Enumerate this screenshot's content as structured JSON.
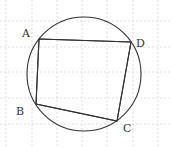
{
  "diagram": {
    "type": "cyclic-quadrilateral",
    "circle": {
      "cx": 84,
      "cy": 74,
      "r": 57
    },
    "vertices": [
      {
        "name": "A",
        "x": 39,
        "y": 39,
        "label": "A",
        "label_x": 22,
        "label_y": 37
      },
      {
        "name": "B",
        "x": 36,
        "y": 104,
        "label": "B",
        "label_x": 16,
        "label_y": 115
      },
      {
        "name": "C",
        "x": 117,
        "y": 121,
        "label": "C",
        "label_x": 123,
        "label_y": 132
      },
      {
        "name": "D",
        "x": 131,
        "y": 42,
        "label": "D",
        "label_x": 136,
        "label_y": 47
      }
    ],
    "edges": [
      "AD",
      "DC",
      "CB",
      "BA"
    ],
    "grid": {
      "spacing": 25.3,
      "offset_x": 6,
      "offset_y": 21
    },
    "colors": {
      "stroke": "#333333",
      "grid": "#d9d9d9",
      "background": "#ffffff"
    }
  },
  "labels": {
    "A": "A",
    "B": "B",
    "C": "C",
    "D": "D"
  }
}
